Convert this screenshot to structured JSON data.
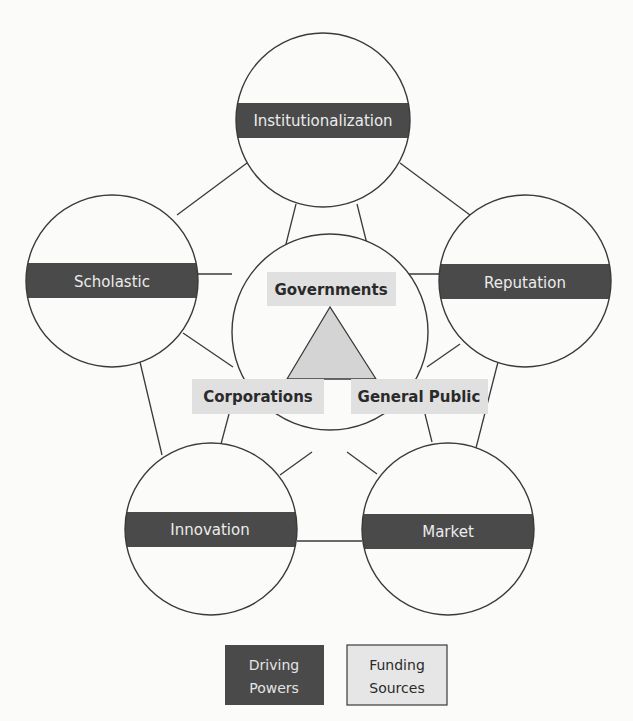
{
  "diagram": {
    "colors": {
      "background": "#fbfbfa",
      "line": "#3a3a3a",
      "driving_band": "#4a4a4a",
      "driving_text": "#ececec",
      "funding_box": "#e0e0e0",
      "funding_text": "#2a2a2a",
      "triangle_fill": "#d4d4d4"
    },
    "driving_powers": [
      {
        "id": "institutionalization",
        "label": "Institutionalization"
      },
      {
        "id": "scholastic",
        "label": "Scholastic"
      },
      {
        "id": "reputation",
        "label": "Reputation"
      },
      {
        "id": "innovation",
        "label": "Innovation"
      },
      {
        "id": "market",
        "label": "Market"
      }
    ],
    "funding_sources": [
      {
        "id": "governments",
        "label": "Governments"
      },
      {
        "id": "corporations",
        "label": "Corporations"
      },
      {
        "id": "general-public",
        "label": "General Public"
      }
    ],
    "legend": {
      "driving_line1": "Driving",
      "driving_line2": "Powers",
      "funding_line1": "Funding",
      "funding_line2": "Sources"
    }
  }
}
